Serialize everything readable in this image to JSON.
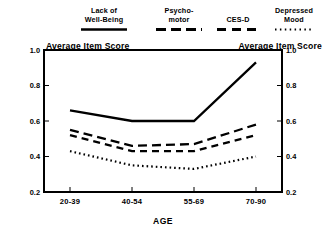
{
  "chart_data": {
    "type": "line",
    "title": "",
    "xlabel": "AGE",
    "ylabel": "Average Item Score",
    "ylabel_right": "Average Item Score",
    "categories": [
      "20-39",
      "40-54",
      "55-69",
      "70-90"
    ],
    "ylim": [
      0.2,
      1.0
    ],
    "yticks": [
      "0.2",
      "0.4",
      "0.6",
      "0.8",
      "1.0"
    ],
    "ytick_values": [
      0.2,
      0.4,
      0.6,
      0.8,
      1.0
    ],
    "grid": false,
    "legend_position": "top",
    "series": [
      {
        "name": "Lack of Well-Being",
        "label_line1": "Lack of",
        "label_line2": "Well-Being",
        "style": "solid",
        "dash": "none",
        "color": "#000000",
        "values": [
          0.66,
          0.6,
          0.6,
          0.93
        ]
      },
      {
        "name": "Psychomotor",
        "label_line1": "Psycho-",
        "label_line2": "motor",
        "style": "long-dash",
        "dash": "9,5",
        "color": "#000000",
        "values": [
          0.55,
          0.46,
          0.47,
          0.58
        ]
      },
      {
        "name": "CES-D",
        "label_line1": "CES-D",
        "label_line2": "",
        "style": "medium-dash",
        "dash": "7,5",
        "color": "#000000",
        "values": [
          0.52,
          0.43,
          0.43,
          0.52
        ]
      },
      {
        "name": "Depressed Mood",
        "label_line1": "Depressed",
        "label_line2": "Mood",
        "style": "dotted",
        "dash": "1.6,3",
        "color": "#000000",
        "values": [
          0.43,
          0.35,
          0.33,
          0.4
        ]
      }
    ]
  },
  "legend": {
    "items": [
      {
        "line1": "Lack of",
        "line2": "Well-Being"
      },
      {
        "line1": "Psycho-",
        "line2": "motor"
      },
      {
        "line1": "CES-D",
        "line2": ""
      },
      {
        "line1": "Depressed",
        "line2": "Mood"
      }
    ]
  },
  "axes": {
    "y_left_title": "Average Item Score",
    "y_right_title": "Average Item Score",
    "x_title": "AGE",
    "y_ticks_left": [
      "1.0",
      "0.8",
      "0.6",
      "0.4",
      "0.2"
    ],
    "y_ticks_right": [
      "1.0",
      "0.8",
      "0.6",
      "0.4",
      "0.2"
    ],
    "x_ticks": [
      "20-39",
      "40-54",
      "55-69",
      "70-90"
    ]
  },
  "colors": {
    "ink": "#000000",
    "background": "#ffffff"
  }
}
